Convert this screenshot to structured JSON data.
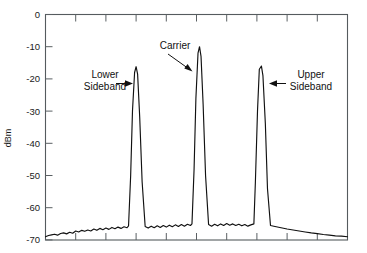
{
  "chart_data": {
    "type": "line",
    "title": "",
    "xlabel": "",
    "ylabel": "dBm",
    "ylim": [
      -70,
      0
    ],
    "ytick_labels": [
      "0",
      "-10",
      "-20",
      "-30",
      "-40",
      "-50",
      "-60",
      "-70"
    ],
    "ytick_values": [
      0,
      -10,
      -20,
      -30,
      -40,
      -50,
      -60,
      -70
    ],
    "xlim": [
      0,
      10
    ],
    "xtick_labels": [
      "",
      "",
      "",
      "",
      "",
      "",
      "",
      "",
      "",
      "",
      ""
    ],
    "xtick_values": [
      0,
      1,
      2,
      3,
      4,
      5,
      6,
      7,
      8,
      9,
      10
    ],
    "grid": false,
    "legend": "none",
    "series": [
      {
        "name": "spectrum",
        "x": [
          0.0,
          0.1,
          0.2,
          0.3,
          0.4,
          0.5,
          0.6,
          0.7,
          0.8,
          0.9,
          1.0,
          1.1,
          1.2,
          1.3,
          1.4,
          1.5,
          1.6,
          1.7,
          1.8,
          1.9,
          2.0,
          2.1,
          2.2,
          2.3,
          2.4,
          2.5,
          2.6,
          2.7,
          2.75,
          2.82,
          2.88,
          2.95,
          3.0,
          3.05,
          3.12,
          3.2,
          3.3,
          3.4,
          3.5,
          3.6,
          3.7,
          3.8,
          3.9,
          4.0,
          4.1,
          4.2,
          4.3,
          4.4,
          4.5,
          4.6,
          4.7,
          4.8,
          4.85,
          4.92,
          4.98,
          5.05,
          5.1,
          5.15,
          5.22,
          5.3,
          5.4,
          5.5,
          5.6,
          5.7,
          5.8,
          5.9,
          6.0,
          6.1,
          6.2,
          6.3,
          6.4,
          6.5,
          6.6,
          6.7,
          6.8,
          6.9,
          6.95,
          7.02,
          7.08,
          7.15,
          7.2,
          7.28,
          7.35,
          7.45,
          7.6,
          7.8,
          8.0,
          8.2,
          8.4,
          8.6,
          8.8,
          9.0,
          9.2,
          9.4,
          9.6,
          9.8,
          10.0
        ],
        "y": [
          -69.0,
          -68.6,
          -68.4,
          -68.2,
          -68.5,
          -68.0,
          -67.8,
          -68.1,
          -67.6,
          -67.9,
          -67.2,
          -67.5,
          -67.0,
          -67.3,
          -66.9,
          -67.2,
          -66.6,
          -67.0,
          -66.4,
          -66.8,
          -66.3,
          -66.7,
          -66.1,
          -66.5,
          -66.0,
          -66.4,
          -65.9,
          -66.2,
          -65.6,
          -50.0,
          -30.0,
          -18.0,
          -16.2,
          -18.5,
          -32.0,
          -52.0,
          -65.8,
          -66.3,
          -65.7,
          -66.2,
          -65.6,
          -66.1,
          -65.5,
          -66.0,
          -65.4,
          -65.9,
          -65.3,
          -65.8,
          -65.2,
          -65.7,
          -65.1,
          -65.5,
          -65.0,
          -48.0,
          -26.0,
          -12.0,
          -10.0,
          -13.0,
          -28.0,
          -50.0,
          -65.2,
          -65.7,
          -65.1,
          -65.6,
          -65.0,
          -65.5,
          -64.9,
          -65.4,
          -65.0,
          -65.5,
          -65.1,
          -65.6,
          -65.2,
          -65.7,
          -65.3,
          -65.0,
          -52.0,
          -30.0,
          -17.0,
          -16.0,
          -19.0,
          -34.0,
          -54.0,
          -65.5,
          -65.8,
          -66.2,
          -66.6,
          -66.9,
          -67.2,
          -67.5,
          -67.8,
          -68.0,
          -68.3,
          -68.5,
          -68.7,
          -68.8,
          -69.0
        ]
      }
    ],
    "peaks": [
      {
        "name": "lower-sideband",
        "x": 3.0,
        "y": -16.2,
        "label": "Lower\nSideband"
      },
      {
        "name": "carrier",
        "x": 5.1,
        "y": -10.0,
        "label": "Carrier"
      },
      {
        "name": "upper-sideband",
        "x": 7.15,
        "y": -16.0,
        "label": "Upper\nSideband"
      }
    ]
  },
  "annotations": {
    "lower_sideband": {
      "line1": "Lower",
      "line2": "Sideband"
    },
    "carrier": {
      "line1": "Carrier"
    },
    "upper_sideband": {
      "line1": "Upper",
      "line2": "Sideband"
    }
  },
  "axis": {
    "y_title": "dBm",
    "y_labels": [
      "0",
      "-10",
      "-20",
      "-30",
      "-40",
      "-50",
      "-60",
      "-70"
    ]
  },
  "colors": {
    "trace": "#111111",
    "frame": "#555b5e",
    "text": "#111111",
    "background": "#ffffff"
  }
}
